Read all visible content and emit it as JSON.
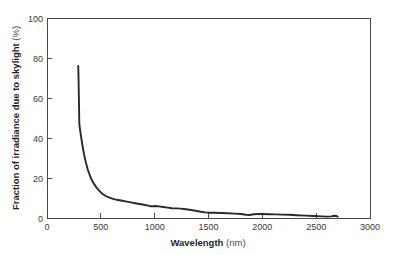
{
  "chart_data": {
    "type": "line",
    "title": "",
    "xlabel": "Wavelength",
    "xlabel_unit": "(nm)",
    "ylabel": "Fraction of irradiance due to skylight",
    "ylabel_unit": "(%)",
    "ylabel_full": "Fraction of irradiance due to skylight (%)",
    "xlim": [
      0,
      3000
    ],
    "ylim": [
      0,
      100
    ],
    "xticks": [
      0,
      500,
      1000,
      1500,
      2000,
      2500,
      3000
    ],
    "yticks": [
      0,
      20,
      40,
      60,
      80,
      100
    ],
    "xtick_labels": [
      "0",
      "500",
      "1000",
      "1500",
      "2000",
      "2500",
      "3000"
    ],
    "ytick_labels": [
      "0",
      "20",
      "40",
      "60",
      "80",
      "100"
    ],
    "grid": false,
    "legend": false,
    "legend_position": "none",
    "line_color": "#2a2a2a",
    "axis_color": "#4a4a4a",
    "background_color": "#ffffff",
    "series": [
      {
        "name": "Fraction of irradiance due to skylight",
        "x": [
          290,
          292,
          296,
          300,
          302,
          310,
          320,
          330,
          345,
          360,
          380,
          400,
          420,
          440,
          460,
          480,
          500,
          520,
          545,
          570,
          600,
          630,
          660,
          700,
          740,
          780,
          820,
          860,
          900,
          940,
          960,
          985,
          1010,
          1040,
          1080,
          1120,
          1160,
          1200,
          1240,
          1290,
          1340,
          1390,
          1430,
          1470,
          1510,
          1560,
          1620,
          1680,
          1740,
          1800,
          1850,
          1880,
          1920,
          1960,
          2000,
          2060,
          2120,
          2180,
          2250,
          2320,
          2400,
          2480,
          2550,
          2600,
          2640,
          2670,
          2690,
          2700
        ],
        "y": [
          76.0,
          72.0,
          61.0,
          47.5,
          46.0,
          43.0,
          39.5,
          36.0,
          31.5,
          28.0,
          24.0,
          21.0,
          18.6,
          16.8,
          15.2,
          13.9,
          12.8,
          11.9,
          11.0,
          10.4,
          9.8,
          9.3,
          9.0,
          8.6,
          8.2,
          7.8,
          7.4,
          7.0,
          6.6,
          6.2,
          5.9,
          5.9,
          6.0,
          5.8,
          5.5,
          5.2,
          4.9,
          4.8,
          4.7,
          4.4,
          4.0,
          3.5,
          3.1,
          2.8,
          2.6,
          2.6,
          2.5,
          2.4,
          2.2,
          2.0,
          1.6,
          1.5,
          1.9,
          2.0,
          2.0,
          1.9,
          1.8,
          1.7,
          1.6,
          1.4,
          1.2,
          1.0,
          0.8,
          0.7,
          0.8,
          1.1,
          1.0,
          0.6
        ]
      }
    ],
    "annotations": [],
    "data_range_note": {
      "x_start": 290,
      "x_end": 2700,
      "y_max": 76.0,
      "y_at_end": 0.6
    }
  }
}
